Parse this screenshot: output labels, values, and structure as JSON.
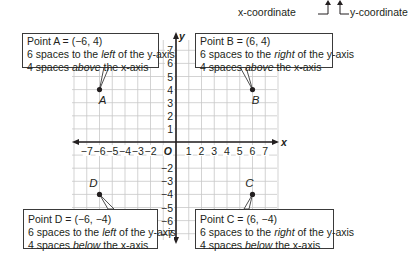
{
  "header": {
    "x_caption": "x-coordinate",
    "y_caption": "y-coordinate"
  },
  "chart_data": {
    "type": "scatter",
    "title": "",
    "xlabel": "x",
    "ylabel": "y",
    "xlim": [
      -8,
      8
    ],
    "ylim": [
      -7.5,
      7.5
    ],
    "origin_label": "O",
    "x_ticks": [
      -7,
      -6,
      -5,
      -4,
      -3,
      -2,
      1,
      2,
      3,
      4,
      5,
      6,
      7
    ],
    "y_ticks": [
      7,
      6,
      5,
      4,
      3,
      2,
      1,
      -2,
      -3,
      -4,
      -5,
      -6,
      -7
    ],
    "grid": true,
    "points": [
      {
        "label": "A",
        "x": -6,
        "y": 4
      },
      {
        "label": "B",
        "x": 6,
        "y": 4
      },
      {
        "label": "C",
        "x": 6,
        "y": -4
      },
      {
        "label": "D",
        "x": -6,
        "y": -4
      }
    ]
  },
  "callouts": {
    "A": {
      "title": "Point A = (−6, 4)",
      "line1_pre": "6 spaces to the ",
      "line1_em": "left",
      "line1_post": " of the y-axis",
      "line2_pre": "4 spaces ",
      "line2_em": "above",
      "line2_post": " the x-axis"
    },
    "B": {
      "title": "Point B = (6, 4)",
      "line1_pre": "6 spaces to the ",
      "line1_em": "right",
      "line1_post": " of the y-axis",
      "line2_pre": "4 spaces ",
      "line2_em": "above",
      "line2_post": " the x-axis"
    },
    "C": {
      "title": "Point C = (6, −4)",
      "line1_pre": "6 spaces to the ",
      "line1_em": "right",
      "line1_post": " of the y-axis",
      "line2_pre": "4 spaces ",
      "line2_em": "below",
      "line2_post": " the x-axis"
    },
    "D": {
      "title": "Point D = (−6, −4)",
      "line1_pre": "6 spaces to the ",
      "line1_em": "left",
      "line1_post": " of the y-axis",
      "line2_pre": "4 spaces ",
      "line2_em": "below",
      "line2_post": " the x-axis"
    }
  }
}
